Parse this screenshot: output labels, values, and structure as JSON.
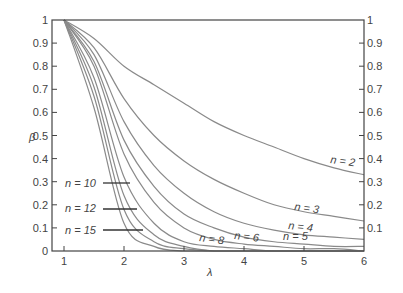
{
  "chart_data": {
    "type": "line",
    "title": "",
    "xlabel": "λ",
    "ylabel": "β",
    "xlim": [
      0.8,
      6
    ],
    "ylim": [
      0,
      1
    ],
    "grid": false,
    "x_ticks": [
      "1",
      "2",
      "3",
      "4",
      "5",
      "6"
    ],
    "y_ticks_left": [
      "0",
      "0.1",
      "0.2",
      "0.3",
      "0.4",
      "0.5",
      "0.6",
      "0.7",
      "0.8",
      "0.9",
      "1"
    ],
    "y_ticks_right": [
      "0.1",
      "0.2",
      "0.3",
      "0.4",
      "0.5",
      "0.6",
      "0.7",
      "0.8",
      "0.9",
      "1"
    ],
    "x": [
      1,
      1.5,
      2,
      2.5,
      3,
      3.5,
      4,
      4.5,
      5,
      5.5,
      6
    ],
    "series": [
      {
        "name": "n = 2",
        "values": [
          1.0,
          0.92,
          0.8,
          0.72,
          0.64,
          0.56,
          0.5,
          0.45,
          0.4,
          0.36,
          0.33
        ]
      },
      {
        "name": "n = 3",
        "values": [
          1.0,
          0.88,
          0.66,
          0.5,
          0.39,
          0.31,
          0.25,
          0.2,
          0.17,
          0.15,
          0.13
        ]
      },
      {
        "name": "n = 4",
        "values": [
          1.0,
          0.85,
          0.56,
          0.37,
          0.25,
          0.17,
          0.12,
          0.09,
          0.07,
          0.06,
          0.05
        ]
      },
      {
        "name": "n = 5",
        "values": [
          1.0,
          0.82,
          0.48,
          0.28,
          0.16,
          0.1,
          0.06,
          0.04,
          0.03,
          0.02,
          0.02
        ]
      },
      {
        "name": "n = 6",
        "values": [
          1.0,
          0.8,
          0.42,
          0.21,
          0.1,
          0.05,
          0.03,
          0.02,
          0.01,
          0.01,
          0.0
        ]
      },
      {
        "name": "n = 8",
        "values": [
          1.0,
          0.75,
          0.32,
          0.12,
          0.04,
          0.02,
          0.01,
          0.0,
          0.0,
          0.0,
          0.0
        ]
      },
      {
        "name": "n = 10",
        "values": [
          1.0,
          0.71,
          0.24,
          0.07,
          0.02,
          0.0,
          0.0,
          0.0,
          0.0,
          0.0,
          0.0
        ]
      },
      {
        "name": "n = 12",
        "values": [
          1.0,
          0.67,
          0.18,
          0.04,
          0.01,
          0.0,
          0.0,
          0.0,
          0.0,
          0.0,
          0.0
        ]
      },
      {
        "name": "n = 15",
        "values": [
          1.0,
          0.62,
          0.12,
          0.02,
          0.0,
          0.0,
          0.0,
          0.0,
          0.0,
          0.0,
          0.0
        ]
      }
    ],
    "annotations": [
      "n = 2",
      "n = 3",
      "n = 4",
      "n = 5",
      "n = 6",
      "n = 8",
      "n = 10",
      "n = 12",
      "n = 15"
    ]
  },
  "labels": {
    "y_axis": "β",
    "x_axis": "λ",
    "n2": "n = 2",
    "n3": "n = 3",
    "n4": "n = 4",
    "n5": "n = 5",
    "n6": "n = 6",
    "n8": "n = 8",
    "n10": "n = 10",
    "n12": "n = 12",
    "n15": "n = 15"
  }
}
